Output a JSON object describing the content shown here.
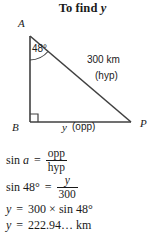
{
  "title": {
    "prefix": "To find ",
    "variable": "y"
  },
  "figure": {
    "vertices": {
      "a_label": "A",
      "b_label": "B",
      "p_label": "P"
    },
    "angle_label": "48°",
    "hypotenuse": {
      "measure": "300 km",
      "side_name": "(hyp)"
    },
    "base": {
      "variable": "y",
      "side_name": "(opp)"
    },
    "right_angle_marker": "right-angle-square",
    "line_color": "#404040"
  },
  "equations": {
    "line1": {
      "lhs_sin": "sin ",
      "lhs_var": "a",
      "equals": "=",
      "numerator": "opp",
      "denominator": "hyp"
    },
    "line2": {
      "lhs": "sin 48°",
      "equals": "=",
      "numerator": "y",
      "denominator": "300"
    },
    "line3": {
      "lhs_var": "y",
      "equals": "=",
      "rhs": "300 × sin 48°"
    },
    "line4": {
      "lhs_var": "y",
      "equals": "=",
      "rhs": "222.94… km"
    }
  }
}
